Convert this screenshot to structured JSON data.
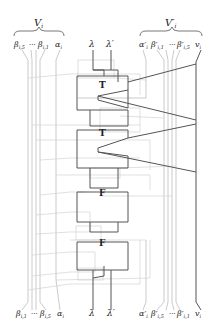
{
  "diagram": {
    "top_left_group": {
      "brace_label": "V_i",
      "brace_label_main": "V",
      "brace_label_sub": "i",
      "terminals": [
        "β_{i,5}",
        "···",
        "β_{i,1}",
        "α_i"
      ],
      "terminal_text": {
        "b5_main": "β",
        "b5_sub": "i,5",
        "dots": "···",
        "b1_main": "β",
        "b1_sub": "i,1",
        "a_main": "α",
        "a_sub": "i"
      }
    },
    "top_center": {
      "lambda": "λ",
      "lambda_prime": "λ′"
    },
    "top_right_group": {
      "brace_label": "V′_i",
      "brace_label_main": "V′",
      "brace_label_sub": "i",
      "terminals": [
        "α′_i",
        "β′_{i,1}",
        "···",
        "β′_{i,5}",
        "v_i"
      ],
      "terminal_text": {
        "a_main": "α′",
        "a_sub": "i",
        "b1_main": "β′",
        "b1_sub": "i,1",
        "dots": "···",
        "b5_main": "β′",
        "b5_sub": "i,5",
        "v_main": "v",
        "v_sub": "i"
      }
    },
    "gadgets": [
      {
        "label": "T",
        "type": "true-gadget"
      },
      {
        "label": "T",
        "type": "true-gadget"
      },
      {
        "label": "F",
        "type": "false-gadget"
      },
      {
        "label": "F",
        "type": "false-gadget"
      }
    ],
    "bottom_left_terminals": {
      "terminal_text": {
        "b1_main": "β",
        "b1_sub": "i,1",
        "dots": "···",
        "b5_main": "β",
        "b5_sub": "i,5",
        "a_main": "α",
        "a_sub": "i"
      }
    },
    "bottom_center": {
      "lambda": "λ",
      "lambda_prime": "λ′"
    },
    "bottom_right_terminals": {
      "terminal_text": {
        "a_main": "α′",
        "a_sub": "i",
        "b5_main": "β′",
        "b5_sub": "i,5",
        "dots": "···",
        "b1_main": "β′",
        "b1_sub": "i,1",
        "v_main": "v",
        "v_sub": "i"
      }
    },
    "colors": {
      "dark_wire": "#555555",
      "light_wire": "#bdbdbd",
      "text": "#222222"
    }
  }
}
